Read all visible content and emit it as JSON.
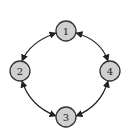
{
  "diagram": {
    "type": "cycle-graph",
    "node_fill": "#d0d0d0",
    "node_stroke": "#333333",
    "edge_color": "#222222",
    "nodes": [
      {
        "id": "1",
        "label": "1",
        "cx": 66,
        "cy": 31
      },
      {
        "id": "2",
        "label": "2",
        "cx": 20,
        "cy": 71
      },
      {
        "id": "3",
        "label": "3",
        "cx": 66,
        "cy": 117
      },
      {
        "id": "4",
        "label": "4",
        "cx": 110,
        "cy": 71
      }
    ],
    "edges": [
      {
        "from": "1",
        "to": "2",
        "direction": "bidirectional"
      },
      {
        "from": "2",
        "to": "3",
        "direction": "bidirectional"
      },
      {
        "from": "3",
        "to": "4",
        "direction": "bidirectional"
      },
      {
        "from": "4",
        "to": "1",
        "direction": "bidirectional"
      }
    ]
  }
}
